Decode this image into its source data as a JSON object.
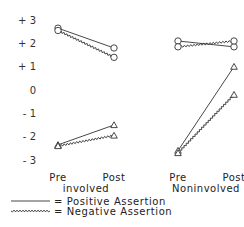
{
  "chart_data": {
    "type": "line",
    "title": "",
    "xlabel": "",
    "ylabel": "",
    "ylim": [
      -3,
      3
    ],
    "yticks": [
      "+ 3",
      "+ 2",
      "+ 1",
      "0",
      "- 1",
      "- 2",
      "- 3"
    ],
    "grid": false,
    "panels": [
      {
        "name": "involved",
        "categories": [
          "Pre",
          "Post"
        ],
        "series": [
          {
            "name": "Positive Assertion (circle)",
            "marker": "circle",
            "style": "solid",
            "values": [
              2.65,
              1.8
            ]
          },
          {
            "name": "Negative Assertion (circle)",
            "marker": "circle",
            "style": "wavy",
            "values": [
              2.55,
              1.4
            ]
          },
          {
            "name": "Positive Assertion (triangle)",
            "marker": "triangle",
            "style": "solid",
            "values": [
              -2.35,
              -1.5
            ]
          },
          {
            "name": "Negative Assertion (triangle)",
            "marker": "triangle",
            "style": "wavy",
            "values": [
              -2.4,
              -1.95
            ]
          }
        ]
      },
      {
        "name": "Noninvolved",
        "categories": [
          "Pre",
          "Post"
        ],
        "series": [
          {
            "name": "Positive Assertion (circle)",
            "marker": "circle",
            "style": "solid",
            "values": [
              2.1,
              1.85
            ]
          },
          {
            "name": "Negative Assertion (circle)",
            "marker": "circle",
            "style": "wavy",
            "values": [
              1.85,
              2.1
            ]
          },
          {
            "name": "Positive Assertion (triangle)",
            "marker": "triangle",
            "style": "solid",
            "values": [
              -2.6,
              1.0
            ]
          },
          {
            "name": "Negative Assertion (triangle)",
            "marker": "triangle",
            "style": "wavy",
            "values": [
              -2.7,
              -0.2
            ]
          }
        ]
      }
    ],
    "legend": [
      {
        "style": "solid",
        "label": "= Positive Assertion"
      },
      {
        "style": "wavy",
        "label": "= Negative Assertion"
      }
    ],
    "legend_position": "bottom-left"
  }
}
